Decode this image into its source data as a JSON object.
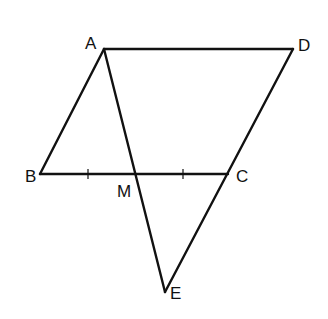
{
  "diagram": {
    "type": "geometry",
    "stroke_color": "#111111",
    "background": "#ffffff",
    "points": {
      "A": {
        "label": "A",
        "x": 104,
        "y": 49
      },
      "D": {
        "label": "D",
        "x": 293,
        "y": 49
      },
      "B": {
        "label": "B",
        "x": 40,
        "y": 174
      },
      "C": {
        "label": "C",
        "x": 228,
        "y": 174
      },
      "M": {
        "label": "M",
        "x": 135,
        "y": 174
      },
      "E": {
        "label": "E",
        "x": 165,
        "y": 292
      }
    },
    "segments": [
      [
        "A",
        "D"
      ],
      [
        "A",
        "B"
      ],
      [
        "B",
        "C"
      ],
      [
        "D",
        "E"
      ],
      [
        "A",
        "E"
      ]
    ],
    "tick_marks": [
      {
        "on": "BM",
        "x": 88,
        "y": 174
      },
      {
        "on": "MC",
        "x": 183,
        "y": 174
      }
    ],
    "labels": {
      "A": "A",
      "B": "B",
      "C": "C",
      "D": "D",
      "M": "M",
      "E": "E"
    }
  }
}
